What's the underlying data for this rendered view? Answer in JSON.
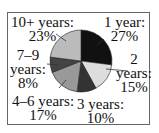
{
  "chart_data": {
    "type": "pie",
    "title": "",
    "categories": [
      "1 year",
      "2 years",
      "3 years",
      "4–6 years",
      "7–9 years",
      "10+ years"
    ],
    "values": [
      27,
      15,
      10,
      17,
      8,
      23
    ],
    "unit": "%",
    "colors": [
      "#111111",
      "#dddddd",
      "#333333",
      "#999999",
      "#444444",
      "#bbbbbb"
    ],
    "start_angle_deg": 0,
    "direction": "clockwise",
    "legend": "none",
    "labels": [
      {
        "line1": "1 year:",
        "line2": "27%"
      },
      {
        "line1": "2",
        "line2": "years:",
        "line3": "15%"
      },
      {
        "line1": "3 years:",
        "line2": "10%"
      },
      {
        "line1": "4–6 years:",
        "line2": "17%"
      },
      {
        "line1": "7–9",
        "line2": "years:",
        "line3": "8%"
      },
      {
        "line1": "10+ years:",
        "line2": "23%"
      }
    ]
  }
}
